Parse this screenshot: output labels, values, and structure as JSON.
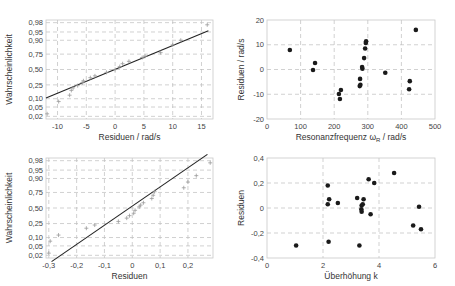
{
  "chart_data": [
    {
      "id": "top-left",
      "type": "scatter",
      "subtype": "normal-probability-plot",
      "title": "",
      "xlabel": "Residuen / rad/s",
      "ylabel": "Wahrscheinlichkeit",
      "xlim": [
        -12,
        17
      ],
      "x_ticks": [
        -10,
        -5,
        0,
        5,
        10,
        15
      ],
      "x_tick_labels": [
        "-10",
        "-5",
        "0",
        "5",
        "10",
        "15"
      ],
      "y_ticks": [
        0.02,
        0.05,
        0.1,
        0.25,
        0.5,
        0.75,
        0.9,
        0.95,
        0.98
      ],
      "y_tick_labels": [
        "0,02",
        "0,05",
        "0,10",
        "0,25",
        "0,50",
        "0,75",
        "0,90",
        "0,95",
        "0,98"
      ],
      "grid": true,
      "marker": "plus",
      "points": [
        {
          "x": -11.8,
          "p": 0.026
        },
        {
          "x": -9.8,
          "p": 0.08
        },
        {
          "x": -7.9,
          "p": 0.13
        },
        {
          "x": -7.6,
          "p": 0.18
        },
        {
          "x": -7.3,
          "p": 0.21
        },
        {
          "x": -6.5,
          "p": 0.24
        },
        {
          "x": -5.7,
          "p": 0.28
        },
        {
          "x": -5.5,
          "p": 0.31
        },
        {
          "x": -4.3,
          "p": 0.36
        },
        {
          "x": -3.5,
          "p": 0.39
        },
        {
          "x": -1.5,
          "p": 0.45
        },
        {
          "x": 0,
          "p": 0.5
        },
        {
          "x": 0.8,
          "p": 0.55
        },
        {
          "x": 1.3,
          "p": 0.6
        },
        {
          "x": 2.4,
          "p": 0.64
        },
        {
          "x": 4.7,
          "p": 0.7
        },
        {
          "x": 5.2,
          "p": 0.72
        },
        {
          "x": 7.9,
          "p": 0.77
        },
        {
          "x": 10.0,
          "p": 0.86
        },
        {
          "x": 11.4,
          "p": 0.9
        },
        {
          "x": 16.0,
          "p": 0.975
        }
      ],
      "fit_line": {
        "x0": -12,
        "p0": 0.105,
        "x1": 16.2,
        "p1": 0.955
      }
    },
    {
      "id": "top-right",
      "type": "scatter",
      "title": "",
      "xlabel": "Resonanzfrequenz ωR / rad/s",
      "xlabel_main": "Resonanzfrequenz ",
      "xlabel_symbol": "ω",
      "xlabel_sub": "R",
      "xlabel_unit": " / rad/s",
      "ylabel": "Residuen / rad/s",
      "xlim": [
        0,
        500
      ],
      "ylim": [
        -20,
        20
      ],
      "x_ticks": [
        0,
        100,
        200,
        300,
        400,
        500
      ],
      "y_ticks": [
        -20,
        -10,
        0,
        10,
        20
      ],
      "grid": true,
      "marker": "filled-circle",
      "points": [
        {
          "x": 68,
          "y": 7.9
        },
        {
          "x": 143,
          "y": 2.6
        },
        {
          "x": 137,
          "y": -0.2
        },
        {
          "x": 214,
          "y": -9.9
        },
        {
          "x": 220,
          "y": -8.3
        },
        {
          "x": 217,
          "y": -11.9
        },
        {
          "x": 277,
          "y": -3.8
        },
        {
          "x": 276,
          "y": -6.7
        },
        {
          "x": 278,
          "y": -6.2
        },
        {
          "x": 283,
          "y": 1.0
        },
        {
          "x": 284,
          "y": 0.3
        },
        {
          "x": 289,
          "y": 4.6
        },
        {
          "x": 292,
          "y": 8.5
        },
        {
          "x": 294,
          "y": 10.7
        },
        {
          "x": 295,
          "y": 11.4
        },
        {
          "x": 352,
          "y": -1.3
        },
        {
          "x": 425,
          "y": -4.7
        },
        {
          "x": 423,
          "y": -8.0
        },
        {
          "x": 443,
          "y": 16.0
        }
      ]
    },
    {
      "id": "bottom-left",
      "type": "scatter",
      "subtype": "normal-probability-plot",
      "title": "",
      "xlabel": "Residuen",
      "ylabel": "Wahrscheinlichkeit",
      "xlim": [
        -0.31,
        0.29
      ],
      "x_ticks": [
        -0.3,
        -0.2,
        -0.1,
        0,
        0.1,
        0.2
      ],
      "x_tick_labels": [
        "-0,3",
        "-0,2",
        "-0,1",
        "0",
        "0,1",
        "0,2"
      ],
      "y_ticks": [
        0.02,
        0.05,
        0.1,
        0.25,
        0.5,
        0.75,
        0.9,
        0.95,
        0.98
      ],
      "y_tick_labels": [
        "0,02",
        "0,05",
        "0,10",
        "0,25",
        "0,50",
        "0,75",
        "0,90",
        "0,95",
        "0,98"
      ],
      "grid": true,
      "marker": "plus",
      "points": [
        {
          "x": -0.3,
          "p": 0.025
        },
        {
          "x": -0.295,
          "p": 0.075
        },
        {
          "x": -0.265,
          "p": 0.12
        },
        {
          "x": -0.165,
          "p": 0.19
        },
        {
          "x": -0.135,
          "p": 0.23
        },
        {
          "x": -0.05,
          "p": 0.28
        },
        {
          "x": -0.02,
          "p": 0.33
        },
        {
          "x": -0.01,
          "p": 0.37
        },
        {
          "x": 0.005,
          "p": 0.41
        },
        {
          "x": 0.01,
          "p": 0.46
        },
        {
          "x": 0.025,
          "p": 0.52
        },
        {
          "x": 0.03,
          "p": 0.55
        },
        {
          "x": 0.04,
          "p": 0.59
        },
        {
          "x": 0.07,
          "p": 0.66
        },
        {
          "x": 0.075,
          "p": 0.71
        },
        {
          "x": 0.08,
          "p": 0.76
        },
        {
          "x": 0.185,
          "p": 0.81
        },
        {
          "x": 0.2,
          "p": 0.87
        },
        {
          "x": 0.23,
          "p": 0.92
        },
        {
          "x": 0.28,
          "p": 0.975
        }
      ],
      "fit_line": {
        "x0": -0.29,
        "p0": 0.01,
        "x1": 0.27,
        "p1": 0.99
      }
    },
    {
      "id": "bottom-right",
      "type": "scatter",
      "title": "",
      "xlabel": "Überhöhung k",
      "ylabel": "Residuen",
      "xlim": [
        0,
        6
      ],
      "ylim": [
        -0.4,
        0.4
      ],
      "x_ticks": [
        0,
        2,
        4,
        6
      ],
      "y_ticks": [
        -0.4,
        -0.2,
        0,
        0.2,
        0.4
      ],
      "y_tick_labels": [
        "-0,4",
        "-0,2",
        "0",
        "0,2",
        "0,4"
      ],
      "grid": true,
      "marker": "filled-circle",
      "points": [
        {
          "x": 1.04,
          "y": -0.3
        },
        {
          "x": 2.17,
          "y": 0.18
        },
        {
          "x": 2.22,
          "y": 0.07
        },
        {
          "x": 2.17,
          "y": 0.03
        },
        {
          "x": 2.2,
          "y": -0.27
        },
        {
          "x": 2.53,
          "y": 0.04
        },
        {
          "x": 3.22,
          "y": 0.08
        },
        {
          "x": 3.38,
          "y": 0.02
        },
        {
          "x": 3.37,
          "y": -0.01
        },
        {
          "x": 3.38,
          "y": -0.03
        },
        {
          "x": 3.42,
          "y": 0.03
        },
        {
          "x": 3.45,
          "y": 0.07
        },
        {
          "x": 3.3,
          "y": -0.3
        },
        {
          "x": 3.63,
          "y": 0.23
        },
        {
          "x": 3.83,
          "y": 0.2
        },
        {
          "x": 3.7,
          "y": -0.05
        },
        {
          "x": 4.54,
          "y": 0.28
        },
        {
          "x": 5.43,
          "y": 0.01
        },
        {
          "x": 5.22,
          "y": -0.14
        },
        {
          "x": 5.5,
          "y": -0.17
        }
      ]
    }
  ],
  "colors": {
    "line": "#222222",
    "marker": "#1a1a1a",
    "plus_marker": "#9a9a9a",
    "grid": "#bdbdbd",
    "frame": "#c8c8c8"
  }
}
